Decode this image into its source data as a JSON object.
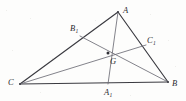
{
  "figure": {
    "background_color": "#fdfdfc",
    "edge_color": "#3a3a40",
    "median_color": "#6d6d76",
    "label_color": "#2b2b30",
    "width": 186,
    "height": 101
  },
  "points": {
    "A": {
      "label": "A",
      "sub": "",
      "x": 118,
      "y": 12
    },
    "B": {
      "label": "B",
      "sub": "",
      "x": 168,
      "y": 82
    },
    "C": {
      "label": "C",
      "sub": "",
      "x": 20,
      "y": 84
    },
    "A1": {
      "label": "A",
      "sub": "1",
      "x": 108,
      "y": 84
    },
    "B1": {
      "label": "B",
      "sub": "1",
      "x": 80,
      "y": 36
    },
    "C1": {
      "label": "C",
      "sub": "1",
      "x": 146,
      "y": 45
    },
    "G": {
      "label": "G",
      "sub": "",
      "x": 108,
      "y": 53
    }
  },
  "labels": {
    "A": {
      "text": "A",
      "sub": "",
      "x": 123,
      "y": 6
    },
    "B": {
      "text": "B",
      "sub": "",
      "x": 172,
      "y": 79
    },
    "C": {
      "text": "C",
      "sub": "",
      "x": 8,
      "y": 78
    },
    "A1": {
      "text": "A",
      "sub": "1",
      "x": 104,
      "y": 88
    },
    "B1": {
      "text": "B",
      "sub": "1",
      "x": 70,
      "y": 24
    },
    "C1": {
      "text": "C",
      "sub": "1",
      "x": 147,
      "y": 36
    },
    "G": {
      "text": "G",
      "sub": "",
      "x": 110,
      "y": 57
    }
  },
  "segments": {
    "sides": [
      {
        "name": "side-CA",
        "from": "C",
        "to": "A"
      },
      {
        "name": "side-AB",
        "from": "A",
        "to": "B"
      },
      {
        "name": "side-CB",
        "from": "C",
        "to": "B"
      }
    ],
    "medians": [
      {
        "name": "median-A-to-A1",
        "from": "A",
        "to": "A1"
      },
      {
        "name": "median-B-to-B1",
        "from": "B",
        "to": "B1"
      },
      {
        "name": "median-C-to-C1",
        "from": "C",
        "to": "C1"
      }
    ]
  }
}
